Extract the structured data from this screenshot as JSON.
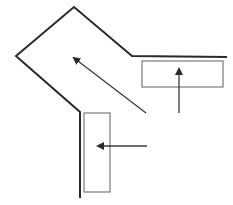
{
  "diagram": {
    "colors": {
      "background": "#ffffff",
      "outline": "#2a2a2a",
      "rect_stroke": "#7a7a7a",
      "arrow": "#3a3a3a"
    },
    "outline_path": [
      [
        80,
        198
      ],
      [
        80,
        112
      ],
      [
        16,
        56
      ],
      [
        74,
        7
      ],
      [
        132,
        56
      ],
      [
        227,
        57
      ]
    ],
    "rectangles": [
      {
        "name": "right-rectangle",
        "x": 142,
        "y": 61,
        "w": 81,
        "h": 26
      },
      {
        "name": "bottom-rectangle",
        "x": 84,
        "y": 113,
        "w": 26,
        "h": 79
      }
    ],
    "arrows": [
      {
        "name": "diagonal-arrow",
        "from": [
          146,
          113
        ],
        "to": [
          74,
          58
        ]
      },
      {
        "name": "up-arrow",
        "from": [
          179,
          113
        ],
        "to": [
          179,
          69
        ]
      },
      {
        "name": "left-arrow",
        "from": [
          147,
          146
        ],
        "to": [
          98,
          146
        ]
      }
    ]
  }
}
